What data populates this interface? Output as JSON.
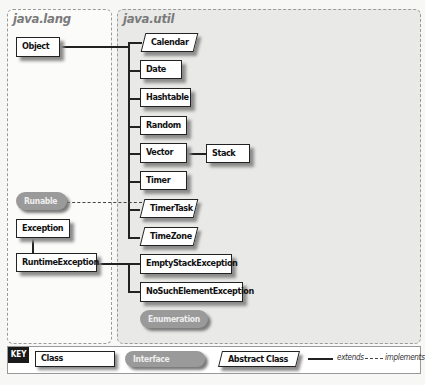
{
  "packages": {
    "lang": {
      "title": "java.lang"
    },
    "util": {
      "title": "java.util"
    }
  },
  "nodes": {
    "object": {
      "label": "Object",
      "kind": "class"
    },
    "calendar": {
      "label": "Calendar",
      "kind": "abstract"
    },
    "date": {
      "label": "Date",
      "kind": "class"
    },
    "hashtable": {
      "label": "Hashtable",
      "kind": "class"
    },
    "random": {
      "label": "Random",
      "kind": "class"
    },
    "vector": {
      "label": "Vector",
      "kind": "class"
    },
    "stack": {
      "label": "Stack",
      "kind": "class"
    },
    "timer": {
      "label": "Timer",
      "kind": "class"
    },
    "timertask": {
      "label": "TimerTask",
      "kind": "abstract"
    },
    "timezone": {
      "label": "TimeZone",
      "kind": "abstract"
    },
    "runable": {
      "label": "Runable",
      "kind": "interface"
    },
    "exception": {
      "label": "Exception",
      "kind": "class"
    },
    "runtimeexception": {
      "label": "RuntimeException",
      "kind": "class"
    },
    "emptystackexception": {
      "label": "EmptyStackException",
      "kind": "class"
    },
    "nosuchelementexception": {
      "label": "NoSuchElementException",
      "kind": "class"
    },
    "enumeration": {
      "label": "Enumeration",
      "kind": "interface"
    }
  },
  "edges": [
    {
      "from": "calendar",
      "to": "object",
      "type": "extends"
    },
    {
      "from": "date",
      "to": "object",
      "type": "extends"
    },
    {
      "from": "hashtable",
      "to": "object",
      "type": "extends"
    },
    {
      "from": "random",
      "to": "object",
      "type": "extends"
    },
    {
      "from": "vector",
      "to": "object",
      "type": "extends"
    },
    {
      "from": "timer",
      "to": "object",
      "type": "extends"
    },
    {
      "from": "timertask",
      "to": "object",
      "type": "extends"
    },
    {
      "from": "timezone",
      "to": "object",
      "type": "extends"
    },
    {
      "from": "stack",
      "to": "vector",
      "type": "extends"
    },
    {
      "from": "timertask",
      "to": "runable",
      "type": "implements"
    },
    {
      "from": "runtimeexception",
      "to": "exception",
      "type": "extends"
    },
    {
      "from": "emptystackexception",
      "to": "runtimeexception",
      "type": "extends"
    },
    {
      "from": "nosuchelementexception",
      "to": "runtimeexception",
      "type": "extends"
    }
  ],
  "key": {
    "title": "KEY",
    "class_label": "Class",
    "interface_label": "Interface",
    "abstract_label": "Abstract Class",
    "extends_label": "extends",
    "implements_label": "implements"
  },
  "colors": {
    "interface_fill": "#9a9a9a",
    "util_panel_bg": "#e9e9e7",
    "line": "#222222"
  }
}
